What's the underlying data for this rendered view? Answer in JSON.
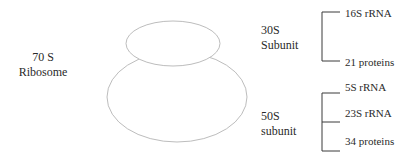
{
  "diagram": {
    "ribosome": {
      "line1": "70 S",
      "line2": "Ribosome"
    },
    "small_subunit": {
      "line1": "30S",
      "line2": "Subunit",
      "components": [
        "16S rRNA",
        "21 proteins"
      ]
    },
    "large_subunit": {
      "line1": "50S",
      "line2": "subunit",
      "components": [
        "5S rRNA",
        "23S rRNA",
        "34 proteins"
      ]
    },
    "colors": {
      "outline": "#b8b8b8",
      "bracket": "#333333",
      "text": "#2a2a2a"
    }
  }
}
